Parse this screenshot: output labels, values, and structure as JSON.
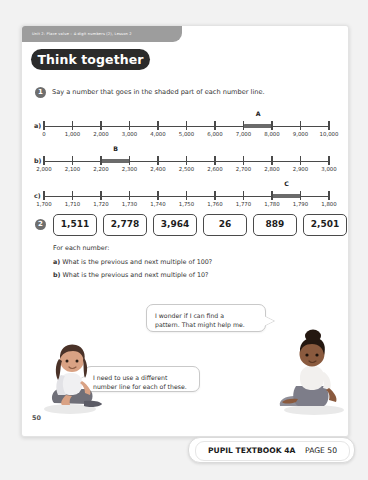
{
  "page": {
    "unit_strip": "Unit 2: Place value – 4-digit numbers (2), Lesson 2",
    "banner_title": "Think together",
    "page_number": "50"
  },
  "question1": {
    "number": "1",
    "prompt": "Say a number that goes in the shaded part of each number line.",
    "lines": [
      {
        "label": "a)",
        "marker": "A",
        "ticks": [
          "0",
          "1,000",
          "2,000",
          "3,000",
          "4,000",
          "5,000",
          "6,000",
          "7,000",
          "8,000",
          "9,000",
          "10,000"
        ],
        "shade_from_index": 7,
        "shade_to_index": 8
      },
      {
        "label": "b)",
        "marker": "B",
        "ticks": [
          "2,000",
          "2,100",
          "2,200",
          "2,300",
          "2,400",
          "2,500",
          "2,600",
          "2,700",
          "2,800",
          "2,900",
          "3,000"
        ],
        "shade_from_index": 2,
        "shade_to_index": 3
      },
      {
        "label": "c)",
        "marker": "C",
        "ticks": [
          "1,700",
          "1,710",
          "1,720",
          "1,730",
          "1,740",
          "1,750",
          "1,760",
          "1,770",
          "1,780",
          "1,790",
          "1,800"
        ],
        "shade_from_index": 8,
        "shade_to_index": 9
      }
    ]
  },
  "question2": {
    "number": "2",
    "numbers": [
      "1,511",
      "2,778",
      "3,964",
      "26",
      "889",
      "2,501"
    ],
    "intro": "For each number:",
    "part_a_label": "a)",
    "part_a_text": " What is the previous and next multiple of 100?",
    "part_b_label": "b)",
    "part_b_text": " What is the previous and next multiple of 10?"
  },
  "speech_bubbles": [
    {
      "name": "bubble-pattern",
      "line1": "I wonder if I can find a",
      "line2": "pattern. That might help me."
    },
    {
      "name": "bubble-number-line",
      "line1": "I need to use a different",
      "line2": "number line for each of these."
    }
  ],
  "characters": [
    {
      "name": "character-girl-left",
      "description": "seated girl with long dark hair"
    },
    {
      "name": "character-girl-right",
      "description": "seated girl with bun hairstyle"
    }
  ],
  "footer": {
    "book": "PUPIL TEXTBOOK 4A",
    "page": "PAGE 50"
  },
  "colors": {
    "banner_bg": "#2b2b2b",
    "unit_strip_bg": "#9d9d9d",
    "axis": "#4a4a4a",
    "shade": "#6b6b6b",
    "page_bg": "#ffffff",
    "backdrop": "#f2f2f2"
  }
}
